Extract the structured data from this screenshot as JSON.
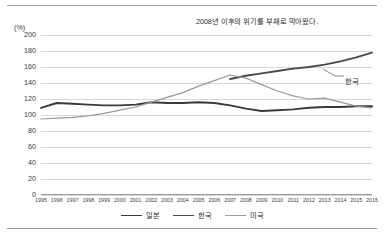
{
  "annotation": "2008년 이후의 위기를 부채로 막아왔다.",
  "unit_label": "(%)",
  "series_labels": {
    "korea_callout": "한국"
  },
  "legend": {
    "items": [
      {
        "label": "일본",
        "color": "#3a3a3a"
      },
      {
        "label": "한국",
        "color": "#4a4a4a"
      },
      {
        "label": "미국",
        "color": "#9a9a9a"
      }
    ]
  },
  "chart_data": {
    "type": "line",
    "title": "2008년 이후의 위기를 부채로 막아왔다.",
    "xlabel": "",
    "ylabel": "(%)",
    "ylim": [
      0,
      200
    ],
    "ytick_step": 20,
    "yticks": [
      200,
      180,
      160,
      140,
      120,
      100,
      80,
      60,
      40,
      20,
      0
    ],
    "grid": true,
    "legend_position": "bottom-center",
    "categories": [
      "1995",
      "1996",
      "1997",
      "1998",
      "1999",
      "2000",
      "2001",
      "2002",
      "2003",
      "2004",
      "2005",
      "2006",
      "2007",
      "2008",
      "2009",
      "2010",
      "2011",
      "2012",
      "2013",
      "2014",
      "2015",
      "2016"
    ],
    "series": [
      {
        "name": "일본",
        "color": "#3a3a3a",
        "values": [
          109,
          115,
          114,
          113,
          112,
          112,
          113,
          116,
          115,
          115,
          116,
          115,
          112,
          108,
          105,
          106,
          107,
          109,
          110,
          110,
          111,
          111
        ]
      },
      {
        "name": "한국",
        "color": "#4a4a4a",
        "values": [
          null,
          null,
          null,
          null,
          null,
          null,
          null,
          null,
          null,
          null,
          null,
          null,
          145,
          149,
          152,
          155,
          158,
          160,
          163,
          167,
          172,
          178
        ]
      },
      {
        "name": "미국",
        "color": "#9a9a9a",
        "values": [
          95,
          96,
          97,
          99,
          102,
          106,
          110,
          116,
          122,
          128,
          136,
          143,
          150,
          146,
          138,
          130,
          124,
          120,
          121,
          116,
          111,
          109
        ]
      }
    ]
  }
}
